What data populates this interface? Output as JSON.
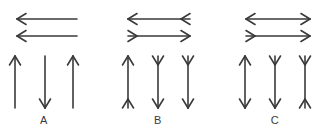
{
  "figure": {
    "title": "",
    "stroke_color": "#3a3a3a",
    "background_color": "#ffffff",
    "groups": [
      {
        "id": "A",
        "label": "A",
        "horizontal_arrows": [
          {
            "name": "a-horizontal-arrow-top",
            "description": "left-pointing arrow, plain right end",
            "left_end": "arrowhead",
            "right_end": "plain",
            "x1": 17,
            "x2": 77,
            "y": 19
          },
          {
            "name": "a-horizontal-arrow-bottom",
            "description": "left-pointing arrow, plain right end",
            "left_end": "arrowhead",
            "right_end": "plain",
            "x1": 17,
            "x2": 77,
            "y": 36
          }
        ],
        "vertical_arrows": [
          {
            "name": "a-vertical-arrow-1",
            "description": "upward arrow, plain bottom",
            "top_end": "arrowhead",
            "bottom_end": "plain",
            "x": 15,
            "y1": 56,
            "y2": 108
          },
          {
            "name": "a-vertical-arrow-2",
            "description": "downward arrow, plain top",
            "top_end": "plain",
            "bottom_end": "arrowhead",
            "x": 45,
            "y1": 56,
            "y2": 108
          },
          {
            "name": "a-vertical-arrow-3",
            "description": "upward arrow, plain bottom",
            "top_end": "arrowhead",
            "bottom_end": "plain",
            "x": 73,
            "y1": 56,
            "y2": 108
          }
        ]
      },
      {
        "id": "B",
        "label": "B",
        "horizontal_arrows": [
          {
            "name": "b-horizontal-arrow-top",
            "description": "arrowhead at left, outward fin at right",
            "left_end": "arrowhead",
            "right_end": "fin",
            "x1": 128,
            "x2": 190,
            "y": 19
          },
          {
            "name": "b-horizontal-arrow-bottom",
            "description": "outward fin at left, arrowhead at right",
            "left_end": "fin",
            "right_end": "arrowhead",
            "x1": 128,
            "x2": 190,
            "y": 36
          }
        ],
        "vertical_arrows": [
          {
            "name": "b-vertical-arrow-1",
            "description": "arrowhead at top, outward fin at bottom",
            "top_end": "arrowhead",
            "bottom_end": "fin",
            "x": 128,
            "y1": 56,
            "y2": 108
          },
          {
            "name": "b-vertical-arrow-2",
            "description": "outward fin at top, arrowhead at bottom",
            "top_end": "fin",
            "bottom_end": "arrowhead",
            "x": 158,
            "y1": 56,
            "y2": 108
          },
          {
            "name": "b-vertical-arrow-3",
            "description": "outward fin at top, arrowhead at bottom",
            "top_end": "fin",
            "bottom_end": "arrowhead",
            "x": 188,
            "y1": 56,
            "y2": 108
          }
        ]
      },
      {
        "id": "C",
        "label": "C",
        "horizontal_arrows": [
          {
            "name": "c-horizontal-arrow-top",
            "description": "arrowheads at both ends",
            "left_end": "arrowhead",
            "right_end": "arrowhead",
            "x1": 246,
            "x2": 310,
            "y": 19
          },
          {
            "name": "c-horizontal-arrow-bottom",
            "description": "outward fin at left, arrowhead at right",
            "left_end": "fin",
            "right_end": "arrowhead",
            "x1": 246,
            "x2": 310,
            "y": 36
          }
        ],
        "vertical_arrows": [
          {
            "name": "c-vertical-arrow-1",
            "description": "arrowheads at top and bottom",
            "top_end": "arrowhead",
            "bottom_end": "arrowhead",
            "x": 245,
            "y1": 56,
            "y2": 108
          },
          {
            "name": "c-vertical-arrow-2",
            "description": "outward fin at top, arrowhead at bottom",
            "top_end": "fin",
            "bottom_end": "arrowhead",
            "x": 275,
            "y1": 56,
            "y2": 108
          },
          {
            "name": "c-vertical-arrow-3",
            "description": "outward fins at top and bottom",
            "top_end": "fin",
            "bottom_end": "fin",
            "x": 305,
            "y1": 56,
            "y2": 108
          }
        ]
      }
    ]
  }
}
